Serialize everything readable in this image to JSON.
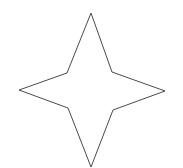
{
  "canvas": {
    "width": 183,
    "height": 168,
    "background_color": "#ffffff"
  },
  "figure": {
    "name": "four-pointed-star",
    "fill_color": "none",
    "stroke_color": "#4a4a4a",
    "stroke_width": 1,
    "points": [
      {
        "label": "top-tip",
        "x": 91,
        "y": 13,
        "kind": "outer"
      },
      {
        "label": "upper-right-inner",
        "x": 112,
        "y": 72,
        "kind": "inner"
      },
      {
        "label": "right-tip",
        "x": 165,
        "y": 91,
        "kind": "outer"
      },
      {
        "label": "lower-right-inner",
        "x": 113,
        "y": 110,
        "kind": "inner"
      },
      {
        "label": "bottom-tip",
        "x": 91,
        "y": 167,
        "kind": "outer"
      },
      {
        "label": "lower-left-inner",
        "x": 68,
        "y": 108,
        "kind": "inner"
      },
      {
        "label": "left-tip",
        "x": 19,
        "y": 90,
        "kind": "outer"
      },
      {
        "label": "upper-left-inner",
        "x": 67,
        "y": 73,
        "kind": "inner"
      }
    ]
  }
}
